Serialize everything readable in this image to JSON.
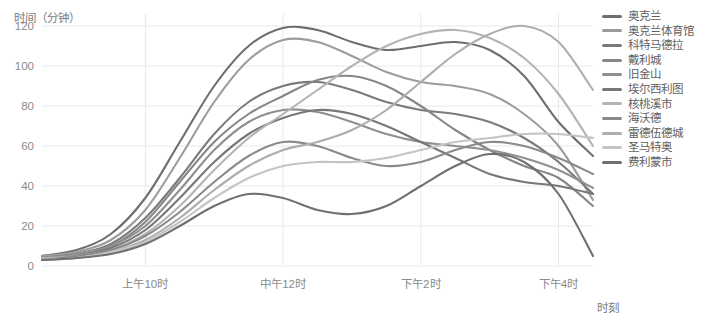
{
  "chart_data": {
    "type": "line",
    "title": "",
    "ylabel": "时间（分钟）",
    "xlabel": "时刻",
    "ylim": [
      0,
      126
    ],
    "yticks": [
      0,
      20,
      40,
      60,
      80,
      100,
      120
    ],
    "ytick_labels": [
      "0",
      "20",
      "40",
      "60",
      "80",
      "100",
      "120"
    ],
    "xlim": [
      8.5,
      16.5
    ],
    "xticks": [
      10,
      12,
      14,
      16
    ],
    "xtick_labels": [
      "上午10时",
      "中午12时",
      "下午2时",
      "下午4时"
    ],
    "grid": true,
    "legend_position": "right",
    "x": [
      8.5,
      9,
      9.5,
      10,
      10.5,
      11,
      11.5,
      12,
      12.5,
      13,
      13.5,
      14,
      14.5,
      15,
      15.5,
      16,
      16.5
    ],
    "series": [
      {
        "name": "奥克兰",
        "color": "#6e6e6e",
        "values": [
          5,
          8,
          16,
          34,
          62,
          90,
          110,
          119,
          118,
          112,
          108,
          110,
          112,
          108,
          95,
          72,
          55
        ]
      },
      {
        "name": "奥克兰体育馆",
        "color": "#9c9c9c",
        "values": [
          5,
          7,
          13,
          28,
          54,
          82,
          103,
          113,
          112,
          105,
          97,
          92,
          90,
          86,
          76,
          60,
          33
        ]
      },
      {
        "name": "科特马德拉",
        "color": "#7b7b7b",
        "values": [
          4,
          6,
          11,
          24,
          44,
          66,
          82,
          90,
          92,
          88,
          82,
          78,
          76,
          72,
          64,
          52,
          36
        ]
      },
      {
        "name": "戴利城",
        "color": "#868686",
        "values": [
          4,
          6,
          10,
          22,
          42,
          62,
          76,
          85,
          93,
          95,
          90,
          80,
          68,
          58,
          50,
          44,
          30
        ]
      },
      {
        "name": "旧金山",
        "color": "#8f8f8f",
        "values": [
          4,
          6,
          10,
          20,
          38,
          58,
          72,
          78,
          77,
          72,
          66,
          62,
          60,
          58,
          54,
          48,
          39
        ]
      },
      {
        "name": "埃尔西利图",
        "color": "#777777",
        "values": [
          4,
          5,
          9,
          18,
          34,
          52,
          66,
          74,
          78,
          76,
          70,
          62,
          54,
          46,
          42,
          40,
          36
        ]
      },
      {
        "name": "核桃溪市",
        "color": "#b4b4b4",
        "values": [
          4,
          5,
          8,
          16,
          30,
          48,
          64,
          76,
          88,
          100,
          110,
          116,
          118,
          114,
          104,
          86,
          60
        ]
      },
      {
        "name": "海沃德",
        "color": "#8a8a8a",
        "values": [
          3,
          5,
          8,
          15,
          27,
          42,
          55,
          62,
          60,
          54,
          50,
          52,
          58,
          62,
          60,
          54,
          46
        ]
      },
      {
        "name": "雷德伍德城",
        "color": "#adadad",
        "values": [
          3,
          4,
          7,
          13,
          24,
          38,
          50,
          58,
          62,
          68,
          78,
          92,
          106,
          116,
          120,
          112,
          88
        ]
      },
      {
        "name": "圣马特奥",
        "color": "#c4c4c4",
        "values": [
          3,
          4,
          7,
          12,
          22,
          34,
          44,
          50,
          52,
          52,
          54,
          58,
          62,
          64,
          66,
          66,
          64
        ]
      },
      {
        "name": "费利蒙市",
        "color": "#707070",
        "values": [
          3,
          4,
          6,
          11,
          20,
          30,
          36,
          34,
          28,
          26,
          30,
          40,
          50,
          56,
          52,
          36,
          5
        ]
      }
    ]
  },
  "legend": {
    "items": [
      {
        "label": "奥克兰",
        "color": "#6e6e6e"
      },
      {
        "label": "奥克兰体育馆",
        "color": "#9c9c9c"
      },
      {
        "label": "科特马德拉",
        "color": "#7b7b7b"
      },
      {
        "label": "戴利城",
        "color": "#868686"
      },
      {
        "label": "旧金山",
        "color": "#8f8f8f"
      },
      {
        "label": "埃尔西利图",
        "color": "#777777"
      },
      {
        "label": "核桃溪市",
        "color": "#b4b4b4"
      },
      {
        "label": "海沃德",
        "color": "#8a8a8a"
      },
      {
        "label": "雷德伍德城",
        "color": "#adadad"
      },
      {
        "label": "圣马特奥",
        "color": "#c4c4c4"
      },
      {
        "label": "费利蒙市",
        "color": "#707070"
      }
    ]
  },
  "colors": {
    "grid": "#e8e8e8",
    "axis_text": "#8a8a8a",
    "title_text": "#7a7a7a",
    "background": "#ffffff"
  }
}
